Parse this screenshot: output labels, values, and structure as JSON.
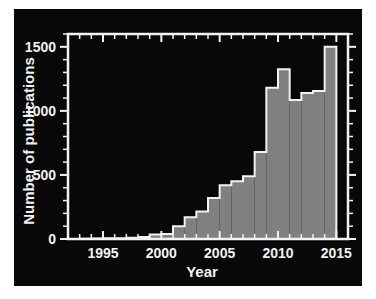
{
  "figure": {
    "background_color": "#ffffff",
    "panel_color": "#080808",
    "axis_color": "#f2f2f2",
    "fill_color": "#808080"
  },
  "chart_data": {
    "type": "bar",
    "title": "",
    "subtitle": "",
    "xlabel": "Year",
    "ylabel": "Number of publications",
    "xlim": [
      1992,
      2016
    ],
    "ylim": [
      0,
      1600
    ],
    "grid": false,
    "legend": null,
    "x_tick_labels": [
      "1995",
      "2000",
      "2005",
      "2010",
      "2015"
    ],
    "x_tick_values": [
      1995,
      2000,
      2005,
      2010,
      2015
    ],
    "x_minor_tick_step": 1,
    "y_tick_labels": [
      "0",
      "500",
      "1000",
      "1500"
    ],
    "y_tick_values": [
      0,
      500,
      1000,
      1500
    ],
    "y_minor_tick_step": 100,
    "categories": [
      1993,
      1994,
      1995,
      1996,
      1997,
      1998,
      1999,
      2000,
      2001,
      2002,
      2003,
      2004,
      2005,
      2006,
      2007,
      2008,
      2009,
      2010,
      2011,
      2012,
      2013,
      2014
    ],
    "values": [
      2,
      3,
      5,
      6,
      9,
      15,
      35,
      40,
      100,
      170,
      215,
      320,
      420,
      450,
      490,
      680,
      1180,
      1325,
      1085,
      1140,
      1155,
      1500
    ],
    "series": [
      {
        "name": "Number of publications",
        "values": [
          2,
          3,
          5,
          6,
          9,
          15,
          35,
          40,
          100,
          170,
          215,
          320,
          420,
          450,
          490,
          680,
          1180,
          1325,
          1085,
          1140,
          1155,
          1500
        ]
      }
    ]
  }
}
